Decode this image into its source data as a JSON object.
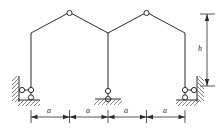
{
  "figure": {
    "type": "structural-frame-diagram",
    "stroke_color": "#2b2b2b",
    "hatch_color": "#555555",
    "background": "#ffffff"
  },
  "geometry": {
    "columns_x": [
      31,
      108,
      185
    ],
    "column_top_y": 33,
    "column_base_y": 86,
    "apex_left": {
      "x": 69.5,
      "y": 13
    },
    "apex_right": {
      "x": 146.5,
      "y": 13
    },
    "hinge_radius": 2.6
  },
  "hinges": [
    {
      "name": "apex-hinge-left",
      "x": 69.5,
      "y": 13
    },
    {
      "name": "apex-hinge-right",
      "x": 146.5,
      "y": 13
    }
  ],
  "supports": [
    {
      "name": "support-left",
      "kind": "wall-roller-and-ground-roller",
      "x": 31,
      "wall_x": 19,
      "roller_y": 90,
      "ground_y": 100
    },
    {
      "name": "support-middle",
      "kind": "ground-roller",
      "x": 108,
      "roller_y": 91,
      "ground_y": 99
    },
    {
      "name": "support-right",
      "kind": "wall-roller-and-ground-roller",
      "x": 185,
      "wall_x": 197,
      "roller_y": 90,
      "ground_y": 100
    }
  ],
  "dimensions": {
    "horizontal": {
      "name": "span-dimension-chain",
      "y": 117,
      "tick_x": [
        31,
        69.5,
        108,
        146.5,
        185
      ],
      "segments": [
        {
          "label": "a",
          "from": 31,
          "to": 69.5
        },
        {
          "label": "a",
          "from": 69.5,
          "to": 108
        },
        {
          "label": "a",
          "from": 108,
          "to": 146.5
        },
        {
          "label": "a",
          "from": 146.5,
          "to": 185
        }
      ]
    },
    "vertical": {
      "name": "height-dimension",
      "label": "h",
      "x": 207,
      "from_y": 14,
      "to_y": 86
    }
  }
}
